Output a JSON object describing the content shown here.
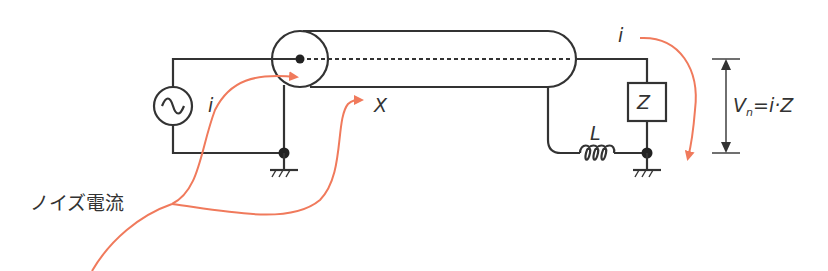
{
  "diagram": {
    "title": "",
    "labels": {
      "source_current": "i",
      "load_current": "i",
      "position_x": "X",
      "inductor": "L",
      "impedance": "Z",
      "noise_voltage_V": "V",
      "noise_voltage_sub": "n",
      "noise_voltage_eq": "=i·Z",
      "noise_current": "ノイズ電流"
    },
    "components": [
      {
        "type": "ac-source",
        "symbol": "~"
      },
      {
        "type": "coaxial-cable"
      },
      {
        "type": "impedance",
        "label": "Z"
      },
      {
        "type": "inductor",
        "label": "L"
      },
      {
        "type": "ground",
        "count": 2
      }
    ],
    "colors": {
      "wire": "#333333",
      "noise_arrow": "#f07a5c",
      "background": "#ffffff"
    }
  }
}
